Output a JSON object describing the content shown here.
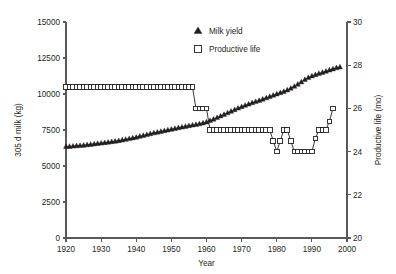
{
  "figure": {
    "background": "#ffffff",
    "ink_color": "#231f20",
    "axis_color": "#58595b"
  },
  "legend": {
    "position": "top-center",
    "entries": [
      {
        "label": "Milk yield",
        "marker": "filled-triangle-icon",
        "color": "#231f20"
      },
      {
        "label": "Productive life",
        "marker": "open-square-icon",
        "color": "#231f20"
      }
    ]
  },
  "chart_data": {
    "type": "line",
    "title": "",
    "xlabel": "Year",
    "ylabel": "305 d milk (kg)",
    "y2label": "Productive life (mo)",
    "xlim": [
      1920,
      2000
    ],
    "ylim": [
      0,
      15000
    ],
    "y2lim": [
      20,
      30
    ],
    "xticks": [
      1920,
      1930,
      1940,
      1950,
      1960,
      1970,
      1980,
      1990,
      2000
    ],
    "yticks": [
      0,
      2500,
      5000,
      7500,
      10000,
      12500,
      15000
    ],
    "y2ticks": [
      20,
      22,
      24,
      26,
      28,
      30
    ],
    "grid": false,
    "legend_position": "top-center",
    "series": [
      {
        "name": "Milk yield",
        "axis": "left",
        "units": "kg",
        "marker": "filled-triangle",
        "x": [
          1920,
          1921,
          1922,
          1923,
          1924,
          1925,
          1926,
          1927,
          1928,
          1929,
          1930,
          1931,
          1932,
          1933,
          1934,
          1935,
          1936,
          1937,
          1938,
          1939,
          1940,
          1941,
          1942,
          1943,
          1944,
          1945,
          1946,
          1947,
          1948,
          1949,
          1950,
          1951,
          1952,
          1953,
          1954,
          1955,
          1956,
          1957,
          1958,
          1959,
          1960,
          1961,
          1962,
          1963,
          1964,
          1965,
          1966,
          1967,
          1968,
          1969,
          1970,
          1971,
          1972,
          1973,
          1974,
          1975,
          1976,
          1977,
          1978,
          1979,
          1980,
          1981,
          1982,
          1983,
          1984,
          1985,
          1986,
          1987,
          1988,
          1989,
          1990,
          1991,
          1992,
          1993,
          1994,
          1995,
          1996,
          1997,
          1998
        ],
        "values": [
          6350,
          6360,
          6380,
          6400,
          6420,
          6440,
          6470,
          6500,
          6530,
          6560,
          6590,
          6620,
          6650,
          6690,
          6720,
          6760,
          6800,
          6850,
          6900,
          6950,
          7000,
          7060,
          7120,
          7180,
          7240,
          7300,
          7350,
          7400,
          7450,
          7500,
          7550,
          7600,
          7650,
          7700,
          7750,
          7800,
          7840,
          7880,
          7930,
          7990,
          8060,
          8150,
          8250,
          8360,
          8470,
          8580,
          8690,
          8800,
          8910,
          9020,
          9120,
          9210,
          9300,
          9390,
          9470,
          9550,
          9640,
          9730,
          9820,
          9910,
          10000,
          10090,
          10180,
          10280,
          10400,
          10530,
          10680,
          10840,
          11000,
          11140,
          11250,
          11340,
          11420,
          11500,
          11580,
          11660,
          11740,
          11820,
          11880
        ]
      },
      {
        "name": "Productive life",
        "axis": "right",
        "units": "mo",
        "marker": "open-square",
        "x": [
          1920,
          1921,
          1922,
          1923,
          1924,
          1925,
          1926,
          1927,
          1928,
          1929,
          1930,
          1931,
          1932,
          1933,
          1934,
          1935,
          1936,
          1937,
          1938,
          1939,
          1940,
          1941,
          1942,
          1943,
          1944,
          1945,
          1946,
          1947,
          1948,
          1949,
          1950,
          1951,
          1952,
          1953,
          1954,
          1955,
          1956,
          1957,
          1958,
          1959,
          1960,
          1961,
          1962,
          1963,
          1964,
          1965,
          1966,
          1967,
          1968,
          1969,
          1970,
          1971,
          1972,
          1973,
          1974,
          1975,
          1976,
          1977,
          1978,
          1979,
          1980,
          1981,
          1982,
          1983,
          1984,
          1985,
          1986,
          1987,
          1988,
          1989,
          1990,
          1991,
          1992,
          1993,
          1994,
          1995,
          1996
        ],
        "values": [
          27,
          27,
          27,
          27,
          27,
          27,
          27,
          27,
          27,
          27,
          27,
          27,
          27,
          27,
          27,
          27,
          27,
          27,
          27,
          27,
          27,
          27,
          27,
          27,
          27,
          27,
          27,
          27,
          27,
          27,
          27,
          27,
          27,
          27,
          27,
          27,
          27,
          26,
          26,
          26,
          26,
          25,
          25,
          25,
          25,
          25,
          25,
          25,
          25,
          25,
          25,
          25,
          25,
          25,
          25,
          25,
          25,
          25,
          25,
          24.5,
          24,
          24.5,
          25,
          25,
          24.5,
          24,
          24,
          24,
          24,
          24,
          24,
          24.6,
          25,
          25,
          25,
          25.4,
          26
        ]
      }
    ]
  }
}
